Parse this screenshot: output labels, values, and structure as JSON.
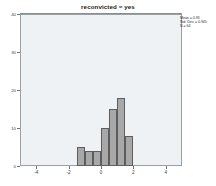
{
  "chart_data": {
    "type": "bar",
    "title": "reconvicted = yes",
    "xlabel": "",
    "ylabel": "",
    "xlim": [
      -5,
      5
    ],
    "ylim": [
      0,
      40
    ],
    "grid": false,
    "legend_position": "top-right",
    "x_ticks": [
      "-4",
      "-2",
      "0",
      "2",
      "4"
    ],
    "x_tick_values": [
      -4,
      -2,
      0,
      2,
      4
    ],
    "y_ticks": [
      "0",
      "10",
      "20",
      "30",
      "40"
    ],
    "y_tick_values": [
      0,
      10,
      20,
      30,
      40
    ],
    "bin_width": 0.5,
    "bin_starts": [
      -1.5,
      -1.0,
      -0.5,
      0.0,
      0.5,
      1.0,
      1.5
    ],
    "categories": [
      "-1.5",
      "-1.0",
      "-0.5",
      "0.0",
      "0.5",
      "1.0",
      "1.5"
    ],
    "values": [
      5,
      4,
      4,
      10,
      15,
      18,
      8
    ],
    "bar_fill_color": "#a8a8a8",
    "bar_edge_color": "#5d5d5d",
    "plot_background_color": "#eef2f4",
    "annotations": {
      "mean_label": "Mean = 0.93",
      "std_dev_label": "Std. Dev. = 0.945",
      "n_label": "N = 64"
    }
  },
  "axes": {
    "y_labels": [
      {
        "text": "40",
        "value": 40
      },
      {
        "text": "30",
        "value": 30
      },
      {
        "text": "20",
        "value": 20
      },
      {
        "text": "10",
        "value": 10
      },
      {
        "text": "0",
        "value": 0
      }
    ],
    "x_labels": [
      {
        "text": "-4",
        "value": -4
      },
      {
        "text": "-2",
        "value": -2
      },
      {
        "text": "0",
        "value": 0
      },
      {
        "text": "2",
        "value": 2
      },
      {
        "text": "4",
        "value": 4
      }
    ]
  },
  "stats": {
    "mean": "Mean = 0.93",
    "std_dev": "Std. Dev. = 0.945",
    "n": "N = 64"
  }
}
